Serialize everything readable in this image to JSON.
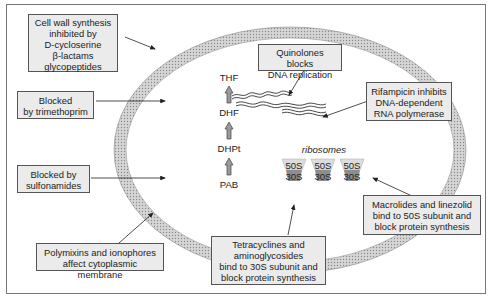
{
  "diagram": {
    "colors": {
      "cell_wall_fill": "#c9c9c9",
      "box_fill": "#ebebeb",
      "arrow_fill": "#999999",
      "border": "#555555"
    },
    "boxes": {
      "cell_wall": {
        "lines": [
          "Cell wall synthesis",
          "inhibited by",
          "D-cycloserine",
          "β-lactams",
          "glycopeptides"
        ]
      },
      "trimethoprim": {
        "lines": [
          "Blocked",
          "by trimethoprim"
        ]
      },
      "sulfonamides": {
        "lines": [
          "Blocked by",
          "sulfonamides"
        ]
      },
      "polymixins": {
        "lines": [
          "Polymixins and ionophores",
          "affect cytoplasmic membrane"
        ]
      },
      "tetracyclines": {
        "lines": [
          "Tetracyclines and",
          "aminoglycosides",
          "bind to 30S subunit and",
          "block protein  synthesis"
        ]
      },
      "macrolides": {
        "lines": [
          "Macrolides and linezolid",
          "bind to 50S subunit and",
          "block protein synthesis"
        ]
      },
      "quinolones": {
        "lines": [
          "Quinolones blocks",
          "DNA replication"
        ]
      },
      "rifampicin": {
        "lines": [
          "Rifampicin inhibits",
          "DNA-dependent",
          "RNA polymerase"
        ]
      }
    },
    "pathway": [
      "THF",
      "DHF",
      "DHPt",
      "PAB"
    ],
    "ribosomes": {
      "label": "ribosomes",
      "units": [
        {
          "large": "50S",
          "small": "30S"
        },
        {
          "large": "50S",
          "small": "30S"
        },
        {
          "large": "50S",
          "small": "30S"
        }
      ]
    }
  }
}
